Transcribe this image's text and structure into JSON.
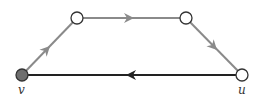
{
  "diagram": {
    "type": "directed-graph",
    "colors": {
      "gray_edge": "#8a8a8a",
      "black_edge": "#222222",
      "node_fill_filled": "#6e6e6e",
      "node_fill_empty": "#ffffff",
      "node_stroke": "#333333"
    },
    "nodes": [
      {
        "id": "v",
        "label": "v",
        "x": 22,
        "y": 75,
        "filled": true
      },
      {
        "id": "a",
        "label": "",
        "x": 77,
        "y": 18,
        "filled": false
      },
      {
        "id": "b",
        "label": "",
        "x": 186,
        "y": 18,
        "filled": false
      },
      {
        "id": "u",
        "label": "u",
        "x": 242,
        "y": 75,
        "filled": false
      }
    ],
    "edges": [
      {
        "from": "v",
        "to": "a",
        "color": "gray"
      },
      {
        "from": "a",
        "to": "b",
        "color": "gray"
      },
      {
        "from": "b",
        "to": "u",
        "color": "gray"
      },
      {
        "from": "u",
        "to": "v",
        "color": "black"
      }
    ],
    "labels": {
      "v": "v",
      "u": "u"
    }
  }
}
